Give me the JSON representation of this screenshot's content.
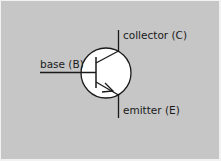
{
  "diagram": {
    "colors": {
      "background": "#c6c6c6",
      "circle_fill": "#ffffff",
      "stroke": "#1a1a1a",
      "text": "#1a1a1a"
    },
    "labels": {
      "collector": "collector (C)",
      "base": "base (B)",
      "emitter": "emitter (E)"
    }
  }
}
